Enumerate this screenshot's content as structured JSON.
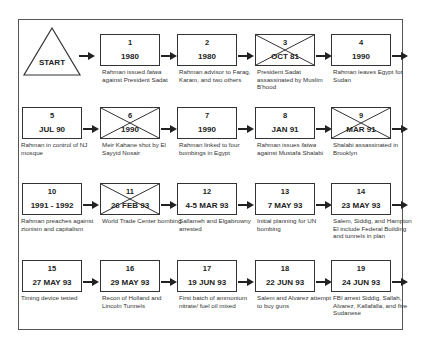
{
  "start": {
    "label": "START"
  },
  "events": [
    {
      "num": "1",
      "date": "1980",
      "desc": "Rahman issued fatwa against President Sadat",
      "crossed": false
    },
    {
      "num": "2",
      "date": "1980",
      "desc": "Rahman advisor to Farag, Karam, and two others",
      "crossed": false
    },
    {
      "num": "3",
      "date": "OCT 81",
      "desc": "President Sadat assassinated by Muslim B'hood",
      "crossed": true
    },
    {
      "num": "4",
      "date": "1990",
      "desc": "Rahman leaves Egypt for Sudan",
      "crossed": false
    },
    {
      "num": "5",
      "date": "JUL 90",
      "desc": "Rahman in control of NJ mosque",
      "crossed": false
    },
    {
      "num": "6",
      "date": "1990",
      "desc": "Meir Kahane shot by El Sayyid Nosair",
      "crossed": true
    },
    {
      "num": "7",
      "date": "1990",
      "desc": "Rahman linked to four bombings in Egypt",
      "crossed": false
    },
    {
      "num": "8",
      "date": "JAN 91",
      "desc": "Rahman issues fatwa against Mustafa Shalabi",
      "crossed": false
    },
    {
      "num": "9",
      "date": "MAR 91",
      "desc": "Shalabi assassinated in Brooklyn",
      "crossed": true
    },
    {
      "num": "10",
      "date": "1991 - 1992",
      "desc": "Rahman preaches against zionism and capitalism",
      "crossed": false
    },
    {
      "num": "11",
      "date": "26 FEB 93",
      "desc": "World Trade Center bombing",
      "crossed": true
    },
    {
      "num": "12",
      "date": "4-5 MAR 93",
      "desc": "Sallameh and Elgabrowny arrested",
      "crossed": false
    },
    {
      "num": "13",
      "date": "7 MAY 93",
      "desc": "Initial planning for UN bombing",
      "crossed": false
    },
    {
      "num": "14",
      "date": "23 MAY 93",
      "desc": "Salem, Siddig, and Hampton El include Federal Building and tunnels in plan",
      "crossed": false
    },
    {
      "num": "15",
      "date": "27 MAY 93",
      "desc": "Timing device tested",
      "crossed": false
    },
    {
      "num": "16",
      "date": "29 MAY 93",
      "desc": "Recon of Holland and Lincoln Tunnels",
      "crossed": false
    },
    {
      "num": "17",
      "date": "19 JUN 93",
      "desc": "First batch of ammonium nitrate/ fuel oil mixed",
      "crossed": false
    },
    {
      "num": "18",
      "date": "22 JUN 93",
      "desc": "Salem and Alvarez attempt to buy guns",
      "crossed": false
    },
    {
      "num": "19",
      "date": "24 JUN 93",
      "desc": "FBI arrest Siddig, Sallah, Alvarez, Kallafalla, and five Sudanese",
      "crossed": false
    }
  ]
}
